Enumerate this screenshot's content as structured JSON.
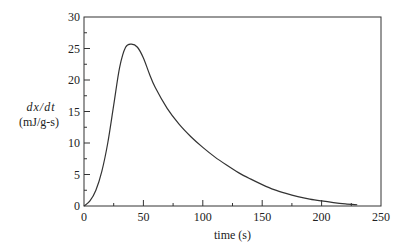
{
  "chart_data": {
    "type": "line",
    "title": "",
    "xlabel": "time (s)",
    "ylabel_line1": "dx/dt",
    "ylabel_line2": "(mJ/g-s)",
    "xlim": [
      0,
      250
    ],
    "ylim": [
      0,
      30
    ],
    "xticks_major": [
      0,
      50,
      100,
      150,
      200,
      250
    ],
    "xticks_minor": [
      25,
      75,
      125,
      175,
      225
    ],
    "yticks_major": [
      0,
      5,
      10,
      15,
      20,
      25,
      30
    ],
    "yticks_minor": [
      2.5,
      7.5,
      12.5,
      17.5,
      22.5,
      27.5
    ],
    "grid": false,
    "legend": null,
    "series": [
      {
        "name": "dx/dt",
        "color": "#333333",
        "x": [
          0,
          5,
          10,
          15,
          20,
          25,
          30,
          35,
          40,
          45,
          50,
          55,
          60,
          70,
          80,
          90,
          100,
          110,
          120,
          130,
          140,
          150,
          160,
          170,
          180,
          190,
          200,
          210,
          220,
          230
        ],
        "y": [
          0,
          0.8,
          2.5,
          5.5,
          10,
          16,
          22,
          25.2,
          25.7,
          25.2,
          23.5,
          21,
          18.8,
          15.5,
          13,
          11,
          9.3,
          7.8,
          6.5,
          5.3,
          4.3,
          3.4,
          2.6,
          2.0,
          1.5,
          1.1,
          0.8,
          0.55,
          0.35,
          0.2
        ]
      }
    ]
  },
  "layout": {
    "plot_left": 84,
    "plot_right": 381,
    "plot_top": 17,
    "plot_bottom": 206
  }
}
